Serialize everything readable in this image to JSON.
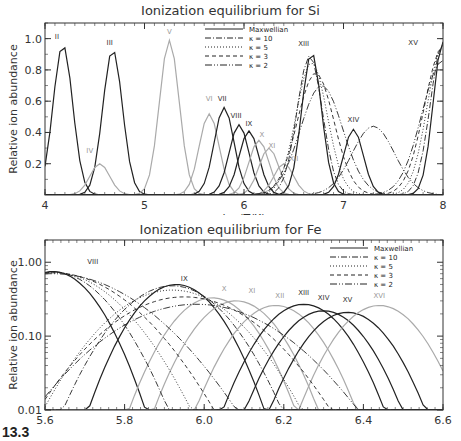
{
  "chart_data": [
    {
      "type": "line",
      "title": "Ionization equilibrium for Si",
      "xlabel": "log(T/K)",
      "ylabel": "Relative ion abundance",
      "xlim": [
        4,
        8
      ],
      "ylim": [
        0,
        1.1
      ],
      "xticks": [
        "4",
        "5",
        "6",
        "7",
        "8"
      ],
      "yticks": [
        "0.2",
        "0.4",
        "0.6",
        "0.8",
        "1.0"
      ],
      "yscale": "linear",
      "grid": false,
      "legend_position": "upper-center",
      "legend": [
        "Maxwellian",
        "κ = 10",
        "κ = 5",
        "κ = 3",
        "κ = 2"
      ],
      "ion_labels": [
        {
          "label": "II",
          "x": 4.12,
          "y": 1.0,
          "gray": false
        },
        {
          "label": "III",
          "x": 4.65,
          "y": 0.96,
          "gray": false
        },
        {
          "label": "IV",
          "x": 4.45,
          "y": 0.27,
          "gray": true
        },
        {
          "label": "V",
          "x": 5.25,
          "y": 1.03,
          "gray": true
        },
        {
          "label": "VI",
          "x": 5.65,
          "y": 0.6,
          "gray": true
        },
        {
          "label": "VII",
          "x": 5.78,
          "y": 0.6,
          "gray": false
        },
        {
          "label": "VIII",
          "x": 5.92,
          "y": 0.49,
          "gray": false
        },
        {
          "label": "IX",
          "x": 6.05,
          "y": 0.44,
          "gray": false
        },
        {
          "label": "X",
          "x": 6.18,
          "y": 0.37,
          "gray": true
        },
        {
          "label": "XI",
          "x": 6.28,
          "y": 0.3,
          "gray": true
        },
        {
          "label": "XII",
          "x": 6.5,
          "y": 0.22,
          "gray": true
        },
        {
          "label": "XIII",
          "x": 6.6,
          "y": 0.95,
          "gray": false
        },
        {
          "label": "XIV",
          "x": 7.1,
          "y": 0.47,
          "gray": false
        },
        {
          "label": "XV",
          "x": 7.7,
          "y": 0.96,
          "gray": false
        }
      ],
      "series": [
        {
          "name": "Maxwellian",
          "peaks": [
            {
              "ion": "II",
              "x": 4.18,
              "y": 0.96
            },
            {
              "ion": "III",
              "x": 4.68,
              "y": 0.93
            },
            {
              "ion": "IV",
              "x": 4.55,
              "y": 0.2
            },
            {
              "ion": "V",
              "x": 5.25,
              "y": 0.99
            },
            {
              "ion": "VI",
              "x": 5.65,
              "y": 0.52
            },
            {
              "ion": "VII",
              "x": 5.8,
              "y": 0.56
            },
            {
              "ion": "VIII",
              "x": 5.95,
              "y": 0.45
            },
            {
              "ion": "IX",
              "x": 6.05,
              "y": 0.41
            },
            {
              "ion": "X",
              "x": 6.15,
              "y": 0.35
            },
            {
              "ion": "XI",
              "x": 6.25,
              "y": 0.3
            },
            {
              "ion": "XII",
              "x": 6.4,
              "y": 0.2
            },
            {
              "ion": "XIII",
              "x": 6.68,
              "y": 0.91
            },
            {
              "ion": "XIV",
              "x": 7.1,
              "y": 0.42
            },
            {
              "ion": "XV",
              "x": 8.0,
              "y": 0.98
            }
          ]
        },
        {
          "name": "κ = 10",
          "peaks": [
            {
              "ion": "XIII",
              "x": 6.66,
              "y": 0.89
            },
            {
              "ion": "XV",
              "x": 8.0,
              "y": 0.97
            }
          ]
        },
        {
          "name": "κ = 5",
          "peaks": [
            {
              "ion": "XIII",
              "x": 6.68,
              "y": 0.85
            },
            {
              "ion": "XV",
              "x": 8.0,
              "y": 0.96
            }
          ]
        },
        {
          "name": "κ = 3",
          "peaks": [
            {
              "ion": "XIII",
              "x": 6.72,
              "y": 0.78
            },
            {
              "ion": "XV",
              "x": 8.0,
              "y": 0.95
            }
          ]
        },
        {
          "name": "κ = 2",
          "peaks": [
            {
              "ion": "XIII",
              "x": 6.78,
              "y": 0.7
            },
            {
              "ion": "XIV",
              "x": 7.3,
              "y": 0.44
            },
            {
              "ion": "XV",
              "x": 8.0,
              "y": 0.86
            }
          ]
        }
      ]
    },
    {
      "type": "line",
      "title": "Ionization equilibrium for Fe",
      "xlabel": "log(T/K)",
      "ylabel": "Relative ion abundance",
      "xlim": [
        5.6,
        6.6
      ],
      "ylim": [
        0.01,
        2.0
      ],
      "xticks": [
        "5.6",
        "5.8",
        "6.0",
        "6.2",
        "6.4",
        "6.6"
      ],
      "yticks": [
        "0.01",
        "0.10",
        "1.00"
      ],
      "yscale": "log",
      "grid": false,
      "legend_position": "upper-right",
      "legend": [
        "Maxwellian",
        "κ = 10",
        "κ = 5",
        "κ = 3",
        "κ = 2"
      ],
      "ion_labels": [
        {
          "label": "VIII",
          "x": 5.72,
          "y": 0.95,
          "gray": false
        },
        {
          "label": "IX",
          "x": 5.95,
          "y": 0.55,
          "gray": false
        },
        {
          "label": "X",
          "x": 6.05,
          "y": 0.41,
          "gray": true
        },
        {
          "label": "XI",
          "x": 6.12,
          "y": 0.38,
          "gray": true
        },
        {
          "label": "XII",
          "x": 6.19,
          "y": 0.33,
          "gray": true
        },
        {
          "label": "XIII",
          "x": 6.25,
          "y": 0.36,
          "gray": false
        },
        {
          "label": "XIV",
          "x": 6.3,
          "y": 0.31,
          "gray": false
        },
        {
          "label": "XV",
          "x": 6.36,
          "y": 0.29,
          "gray": false
        },
        {
          "label": "XVI",
          "x": 6.44,
          "y": 0.33,
          "gray": true
        }
      ],
      "series": [
        {
          "name": "Maxwellian",
          "peaks": [
            {
              "ion": "VIII",
              "x": 5.62,
              "y": 0.75
            },
            {
              "ion": "IX",
              "x": 5.93,
              "y": 0.5
            },
            {
              "ion": "X",
              "x": 6.02,
              "y": 0.33
            },
            {
              "ion": "XI",
              "x": 6.08,
              "y": 0.3
            },
            {
              "ion": "XII",
              "x": 6.18,
              "y": 0.26
            },
            {
              "ion": "XIII",
              "x": 6.25,
              "y": 0.27
            },
            {
              "ion": "XIV",
              "x": 6.3,
              "y": 0.22
            },
            {
              "ion": "XV",
              "x": 6.36,
              "y": 0.21
            },
            {
              "ion": "XVI",
              "x": 6.44,
              "y": 0.26
            }
          ]
        },
        {
          "name": "κ = 10",
          "peaks": [
            {
              "ion": "VIII",
              "x": 5.62,
              "y": 0.74
            },
            {
              "ion": "IX",
              "x": 5.92,
              "y": 0.48
            }
          ]
        },
        {
          "name": "κ = 5",
          "peaks": [
            {
              "ion": "VIII",
              "x": 5.62,
              "y": 0.73
            },
            {
              "ion": "IX",
              "x": 5.92,
              "y": 0.42
            }
          ]
        },
        {
          "name": "κ = 3",
          "peaks": [
            {
              "ion": "VIII",
              "x": 5.62,
              "y": 0.72
            },
            {
              "ion": "IX",
              "x": 5.95,
              "y": 0.34
            }
          ]
        },
        {
          "name": "κ = 2",
          "peaks": [
            {
              "ion": "VIII",
              "x": 5.62,
              "y": 0.7
            },
            {
              "ion": "IX",
              "x": 5.98,
              "y": 0.27
            }
          ]
        }
      ]
    }
  ],
  "figure_label": "13.3",
  "styles": {
    "dash": {
      "Maxwellian": "",
      "κ = 10": "6 2 1 2",
      "κ = 5": "1 2",
      "κ = 3": "4 3",
      "κ = 2": "7 2 1 2 1 2"
    },
    "dark": "#222222",
    "gray": "#aaaaaa"
  }
}
